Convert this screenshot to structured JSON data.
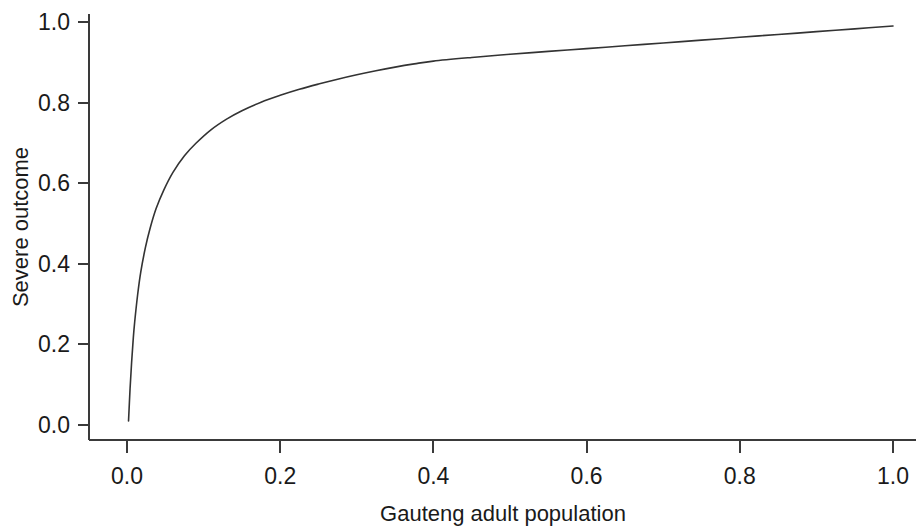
{
  "chart_data": {
    "type": "line",
    "title": "",
    "xlabel": "Gauteng adult population",
    "ylabel": "Severe outcome",
    "xlim": [
      0.0,
      1.0
    ],
    "ylim": [
      0.0,
      1.0
    ],
    "grid": false,
    "legend": null,
    "xticks": [
      "0.0",
      "0.2",
      "0.4",
      "0.6",
      "0.8",
      "1.0"
    ],
    "yticks": [
      "0.0",
      "0.2",
      "0.4",
      "0.6",
      "0.8",
      "1.0"
    ],
    "xtick_values": [
      0.0,
      0.2,
      0.4,
      0.6,
      0.8,
      1.0
    ],
    "ytick_values": [
      0.0,
      0.2,
      0.4,
      0.6,
      0.8,
      1.0
    ],
    "line_color": "#333333",
    "series": [
      {
        "name": "Severe outcome concentration curve",
        "x": [
          0.002,
          0.004,
          0.006,
          0.008,
          0.01,
          0.014,
          0.018,
          0.024,
          0.03,
          0.038,
          0.048,
          0.06,
          0.075,
          0.09,
          0.11,
          0.13,
          0.15,
          0.175,
          0.2,
          0.225,
          0.25,
          0.275,
          0.3,
          0.325,
          0.35,
          0.375,
          0.4,
          0.45,
          0.5,
          0.55,
          0.6,
          0.65,
          0.7,
          0.75,
          0.8,
          0.85,
          0.9,
          0.95,
          1.0
        ],
        "y": [
          0.01,
          0.09,
          0.155,
          0.21,
          0.255,
          0.325,
          0.38,
          0.44,
          0.487,
          0.537,
          0.583,
          0.627,
          0.668,
          0.699,
          0.733,
          0.759,
          0.78,
          0.801,
          0.818,
          0.833,
          0.846,
          0.858,
          0.869,
          0.879,
          0.888,
          0.896,
          0.903,
          0.912,
          0.92,
          0.927,
          0.934,
          0.941,
          0.948,
          0.955,
          0.962,
          0.969,
          0.976,
          0.983,
          0.99
        ]
      }
    ]
  },
  "axes": {
    "x_title": "Gauteng adult population",
    "y_title": "Severe outcome"
  }
}
